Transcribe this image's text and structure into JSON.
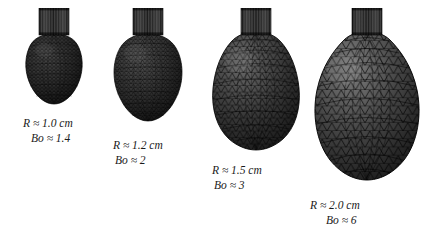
{
  "figure": {
    "background_color": "#ffffff",
    "mesh_line_color": "#101010",
    "surface_color_dark": "#2a2a2a",
    "surface_color_light": "#8a8a8a",
    "nozzle_color": "#1b1b1b"
  },
  "droplets": [
    {
      "id": "droplet-1",
      "radius_symbol": "R",
      "approx": "≈",
      "radius_value": "1.0 cm",
      "bond_symbol": "Bo",
      "bond_value": "1.4",
      "radius_line": "R ≈ 1.0 cm",
      "bond_line": "Bo ≈ 1.4",
      "shape": "near-spherical",
      "mesh_density": "fine"
    },
    {
      "id": "droplet-2",
      "radius_symbol": "R",
      "approx": "≈",
      "radius_value": "1.2 cm",
      "bond_symbol": "Bo",
      "bond_value": "2",
      "radius_line": "R ≈ 1.2 cm",
      "bond_line": "Bo ≈ 2",
      "shape": "slightly-elongated",
      "mesh_density": "fine"
    },
    {
      "id": "droplet-3",
      "radius_symbol": "R",
      "approx": "≈",
      "radius_value": "1.5 cm",
      "bond_symbol": "Bo",
      "bond_value": "3",
      "radius_line": "R ≈ 1.5 cm",
      "bond_line": "Bo ≈ 3",
      "shape": "pear-shaped",
      "mesh_density": "medium"
    },
    {
      "id": "droplet-4",
      "radius_symbol": "R",
      "approx": "≈",
      "radius_value": "2.0 cm",
      "bond_symbol": "Bo",
      "bond_value": "6",
      "radius_line": "R ≈ 2.0 cm",
      "bond_line": "Bo ≈ 6",
      "shape": "elongated-necked",
      "mesh_density": "coarse"
    }
  ]
}
